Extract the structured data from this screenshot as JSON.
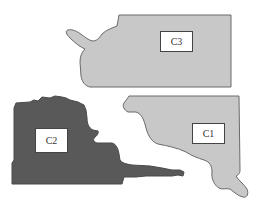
{
  "diagram": {
    "type": "region-map",
    "colors": {
      "background": "#ffffff",
      "light_region_fill": "#c8c8c8",
      "light_region_stroke": "#6a6a6a",
      "dark_region_fill": "#595959",
      "dark_region_stroke": "#4a4a4a",
      "label_box_fill": "#ffffff",
      "label_box_stroke": "#444444"
    },
    "regions": [
      {
        "id": "C3",
        "label": "C3",
        "shade": "light",
        "label_box": {
          "x": 160,
          "y": 31,
          "w": 32,
          "h": 20
        }
      },
      {
        "id": "C2",
        "label": "C2",
        "shade": "dark",
        "label_box": {
          "x": 35,
          "y": 128,
          "w": 32,
          "h": 24
        }
      },
      {
        "id": "C1",
        "label": "C1",
        "shade": "light",
        "label_box": {
          "x": 192,
          "y": 123,
          "w": 32,
          "h": 20
        }
      }
    ]
  }
}
